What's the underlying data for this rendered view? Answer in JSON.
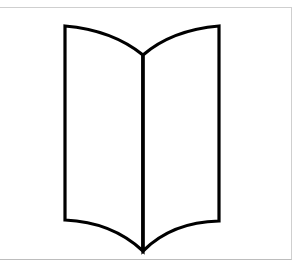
{
  "figure": {
    "icon": "open-book-icon",
    "stroke_color": "#000000",
    "fill_color": "#ffffff",
    "frame_color": "#cfcfcf"
  }
}
